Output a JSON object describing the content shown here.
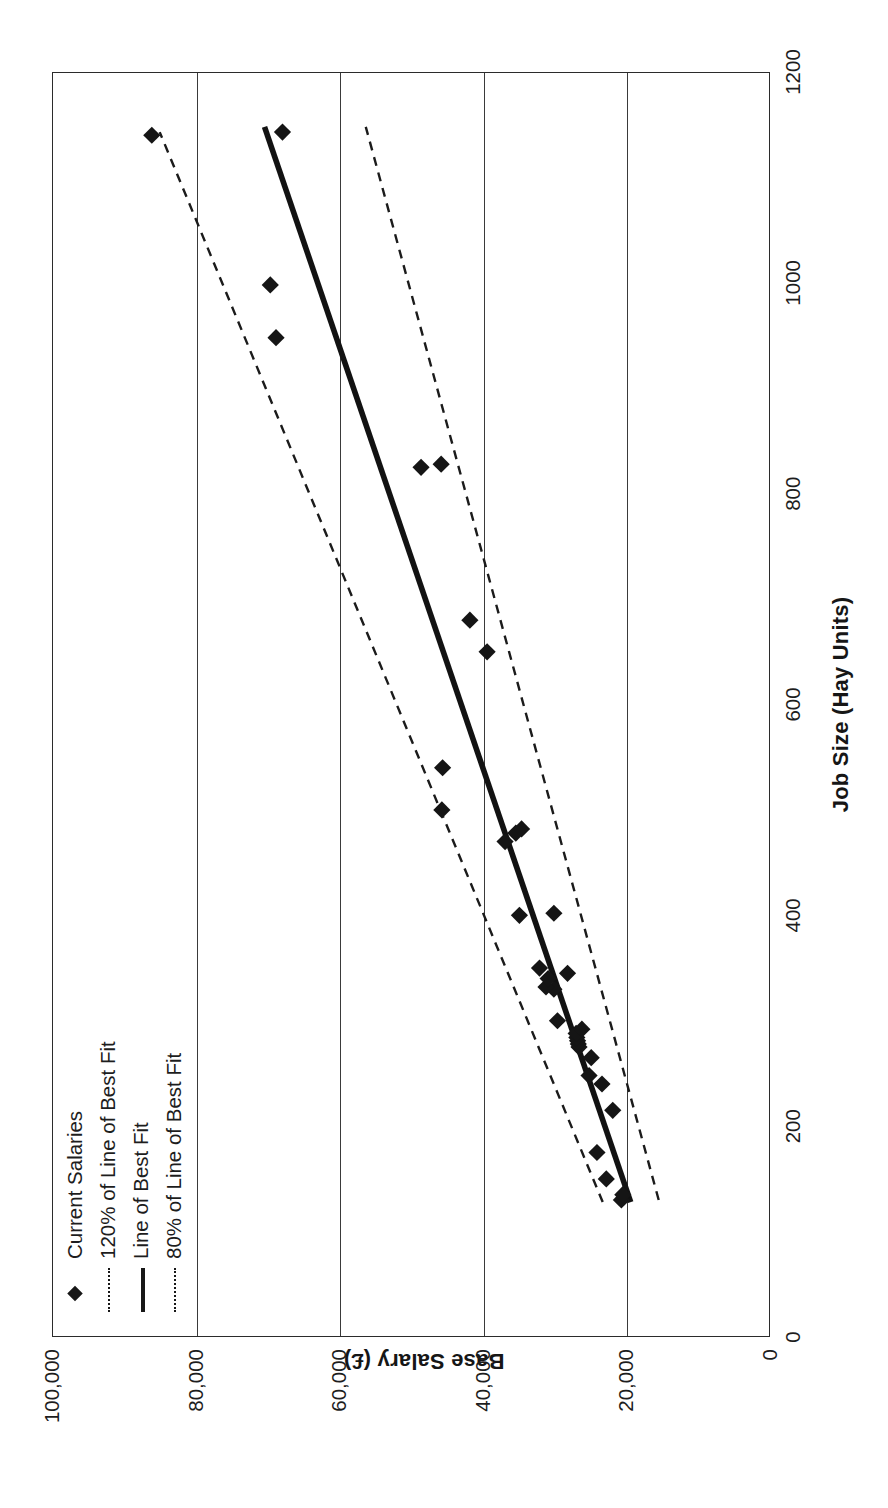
{
  "chart": {
    "title": "",
    "y_axis_title": "Base Salary (£)",
    "x_axis_title": "Job Size (Hay Units)"
  },
  "legend": {
    "items": [
      {
        "label": "Current Salaries",
        "key": "diamond-marker"
      },
      {
        "label": "120% of Line of Best Fit",
        "key": "dashed-line"
      },
      {
        "label": "Line of Best Fit",
        "key": "solid-line"
      },
      {
        "label": "80% of Line of Best Fit",
        "key": "dashed-line"
      }
    ]
  },
  "chart_data": {
    "type": "scatter",
    "title": "",
    "xlabel": "Job Size (Hay Units)",
    "ylabel": "Base Salary (£)",
    "xlim": [
      0,
      1200
    ],
    "ylim": [
      0,
      100000
    ],
    "xticks": [
      0,
      200,
      400,
      600,
      800,
      1000,
      1200
    ],
    "yticks": [
      0,
      20000,
      40000,
      60000,
      80000,
      100000
    ],
    "ytick_labels": [
      "0",
      "20,000",
      "40,000",
      "60,000",
      "80,000",
      "100,000"
    ],
    "xtick_labels": [
      "0",
      "200",
      "400",
      "600",
      "800",
      "1000",
      "1200"
    ],
    "grid": "horizontal",
    "legend_position": "top-left-inside",
    "series": [
      {
        "name": "Current Salaries",
        "type": "scatter",
        "marker": "diamond",
        "color": "#151515",
        "points": [
          [
            130,
            20700
          ],
          [
            135,
            20500
          ],
          [
            150,
            22800
          ],
          [
            175,
            24100
          ],
          [
            215,
            21900
          ],
          [
            240,
            23400
          ],
          [
            248,
            25200
          ],
          [
            265,
            24900
          ],
          [
            275,
            26600
          ],
          [
            278,
            26700
          ],
          [
            281,
            26800
          ],
          [
            284,
            26900
          ],
          [
            288,
            27000
          ],
          [
            292,
            26200
          ],
          [
            300,
            29600
          ],
          [
            330,
            30100
          ],
          [
            332,
            31200
          ],
          [
            340,
            30900
          ],
          [
            345,
            28200
          ],
          [
            350,
            32100
          ],
          [
            400,
            34900
          ],
          [
            402,
            30100
          ],
          [
            470,
            36900
          ],
          [
            478,
            35400
          ],
          [
            482,
            34600
          ],
          [
            500,
            45700
          ],
          [
            540,
            45600
          ],
          [
            650,
            39400
          ],
          [
            680,
            41800
          ],
          [
            825,
            48600
          ],
          [
            828,
            45800
          ],
          [
            948,
            68800
          ],
          [
            998,
            69600
          ],
          [
            1140,
            86100
          ],
          [
            1143,
            67900
          ]
        ]
      },
      {
        "name": "Line of Best Fit",
        "type": "line",
        "style": "solid",
        "color": "#121212",
        "x": [
          128,
          1148
        ],
        "y": [
          19400,
          70400
        ]
      },
      {
        "name": "120% of Line of Best Fit",
        "type": "line",
        "style": "dashed",
        "color": "#1b1b1b",
        "x": [
          128,
          1143
        ],
        "y": [
          23300,
          85000
        ]
      },
      {
        "name": "80% of Line of Best Fit",
        "type": "line",
        "style": "dashed",
        "color": "#1b1b1b",
        "x": [
          130,
          1148
        ],
        "y": [
          15500,
          56300
        ]
      }
    ]
  }
}
